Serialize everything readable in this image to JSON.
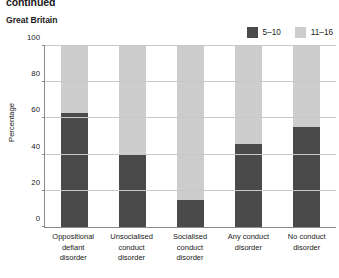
{
  "header": {
    "continued_title": "continued",
    "subtitle": "Great Britain"
  },
  "legend": {
    "position": "top-right",
    "items": [
      {
        "label": "5–10",
        "color": "#4a4a4a",
        "swatch_name": "legend-swatch-5-10"
      },
      {
        "label": "11–16",
        "color": "#cdcdcd",
        "swatch_name": "legend-swatch-11-16"
      }
    ]
  },
  "chart_data": {
    "type": "bar",
    "subtype": "stacked-100",
    "title": "Great Britain",
    "xlabel": "",
    "ylabel": "Percentage",
    "ylim": [
      0,
      100
    ],
    "yticks": [
      0,
      20,
      40,
      60,
      80,
      100
    ],
    "ytick_labels": [
      "0",
      "20",
      "40",
      "60",
      "80",
      "100"
    ],
    "grid": true,
    "legend_position": "top-right",
    "categories": [
      "Oppositional defiant disorder",
      "Unsocialised conduct disorder",
      "Socialised conduct disorder",
      "Any conduct disorder",
      "No conduct disorder"
    ],
    "category_lines": [
      [
        "Oppositional",
        "defiant",
        "disorder"
      ],
      [
        "Unsocialised",
        "conduct",
        "disorder"
      ],
      [
        "Socialised",
        "conduct",
        "disorder"
      ],
      [
        "Any conduct",
        "disorder"
      ],
      [
        "No conduct",
        "disorder"
      ]
    ],
    "series": [
      {
        "name": "5–10",
        "color": "#4a4a4a",
        "values": [
          63,
          40,
          15,
          46,
          55
        ]
      },
      {
        "name": "11–16",
        "color": "#cdcdcd",
        "values": [
          37,
          60,
          85,
          54,
          45
        ]
      }
    ]
  },
  "colors": {
    "dark_gray": "#4a4a4a",
    "light_gray": "#cdcdcd",
    "gridline": "#c8c8c8",
    "axis": "#8a8a8a",
    "text": "#1a1a1a",
    "background": "#ffffff"
  }
}
